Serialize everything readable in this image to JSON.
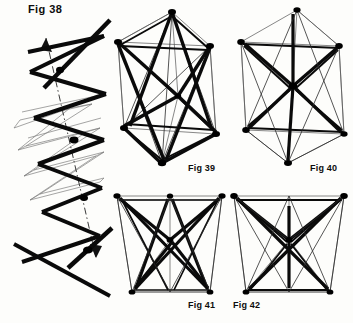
{
  "page": {
    "type": "technical-illustration-plate",
    "background_color": "#fdfdfb",
    "ink_color": "#0a0a0a"
  },
  "figures": [
    {
      "id": "fig-38",
      "label": "Fig 38",
      "caption_position": "top-left",
      "subject": "zigzag helical strut chain with central axis arrow",
      "label_x": 28,
      "label_y": 4
    },
    {
      "id": "fig-39",
      "label": "Fig 39",
      "caption_position": "bottom-right",
      "subject": "tensegrity prism, tall, crossed struts",
      "label_x": 188,
      "label_y": 164
    },
    {
      "id": "fig-40",
      "label": "Fig 40",
      "caption_position": "bottom-right",
      "subject": "tensegrity prism with struts converging at central hub",
      "label_x": 310,
      "label_y": 164
    },
    {
      "id": "fig-41",
      "label": "Fig 41",
      "caption_position": "bottom-right",
      "subject": "tapered tensegrity prism, crossing struts",
      "label_x": 188,
      "label_y": 301
    },
    {
      "id": "fig-42",
      "label": "Fig 42",
      "caption_position": "bottom-left",
      "subject": "tapered tensegrity prism, vertical central strut",
      "label_x": 233,
      "label_y": 301
    }
  ]
}
